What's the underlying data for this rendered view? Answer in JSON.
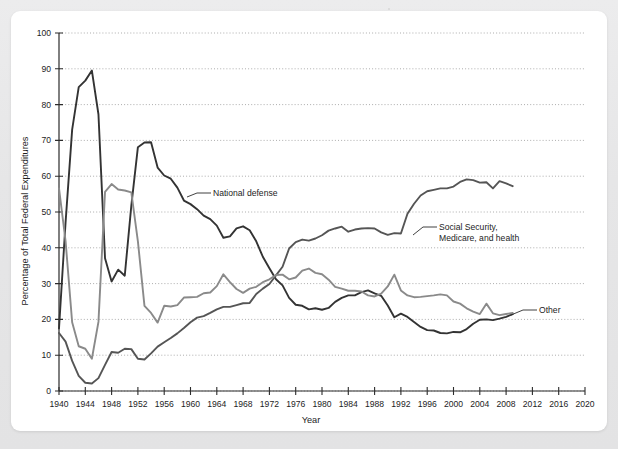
{
  "figure": {
    "panel_background": "#ffffff",
    "page_background": "#e8e8e8"
  },
  "chart_data": {
    "type": "line",
    "title": "",
    "xlabel": "Year",
    "ylabel": "Percentage of Total Federal Expenditures",
    "xlim": [
      1940,
      2020
    ],
    "ylim": [
      0,
      100
    ],
    "xticks": [
      1940,
      1944,
      1948,
      1952,
      1956,
      1960,
      1964,
      1968,
      1972,
      1976,
      1980,
      1984,
      1988,
      1992,
      1996,
      2000,
      2004,
      2008,
      2012,
      2016,
      2020
    ],
    "yticks": [
      0,
      10,
      20,
      30,
      40,
      50,
      60,
      70,
      80,
      90,
      100
    ],
    "xtick_labels": [
      "1940",
      "1944",
      "1948",
      "1952",
      "1956",
      "1960",
      "1964",
      "1968",
      "1972",
      "1976",
      "1980",
      "1984",
      "1988",
      "1992",
      "1996",
      "2000",
      "2004",
      "2008",
      "2012",
      "2016",
      "2020"
    ],
    "ytick_labels": [
      "0",
      "10",
      "20",
      "30",
      "40",
      "50",
      "60",
      "70",
      "80",
      "90",
      "100"
    ],
    "grid": true,
    "grid_axis": "y",
    "legend": "inline-annotations",
    "x": [
      1940,
      1941,
      1942,
      1943,
      1944,
      1945,
      1946,
      1947,
      1948,
      1949,
      1950,
      1951,
      1952,
      1953,
      1954,
      1955,
      1956,
      1957,
      1958,
      1959,
      1960,
      1961,
      1962,
      1963,
      1964,
      1965,
      1966,
      1967,
      1968,
      1969,
      1970,
      1971,
      1972,
      1973,
      1974,
      1975,
      1976,
      1977,
      1978,
      1979,
      1980,
      1981,
      1982,
      1983,
      1984,
      1985,
      1986,
      1987,
      1988,
      1989,
      1990,
      1991,
      1992,
      1993,
      1994,
      1995,
      1996,
      1997,
      1998,
      1999,
      2000,
      2001,
      2002,
      2003,
      2004,
      2005,
      2006,
      2007,
      2008,
      2009
    ],
    "series": [
      {
        "name": "National defense",
        "color": "#333333",
        "label_anchor_year": 1962,
        "values": [
          17.5,
          47.1,
          73.0,
          84.9,
          86.7,
          89.5,
          77.3,
          37.1,
          30.6,
          33.9,
          32.2,
          51.8,
          68.1,
          69.4,
          69.5,
          62.4,
          60.2,
          59.3,
          56.8,
          53.2,
          52.2,
          50.8,
          49.0,
          48.0,
          46.2,
          42.8,
          43.2,
          45.4,
          46.0,
          44.9,
          41.8,
          37.5,
          34.3,
          31.2,
          29.5,
          26.0,
          24.1,
          23.8,
          22.8,
          23.1,
          22.7,
          23.2,
          24.9,
          26.0,
          26.7,
          26.7,
          27.6,
          28.1,
          27.3,
          26.6,
          23.9,
          20.6,
          21.6,
          20.7,
          19.3,
          17.9,
          17.0,
          16.9,
          16.2,
          16.1,
          16.5,
          16.4,
          17.3,
          18.8,
          19.9,
          20.0,
          19.8,
          20.2,
          20.7,
          21.5
        ]
      },
      {
        "name": "Social Security, Medicare, and health",
        "color": "#555555",
        "label_anchor_year": 1990,
        "values": [
          16.2,
          13.8,
          8.4,
          4.2,
          2.3,
          2.1,
          3.6,
          7.3,
          10.9,
          10.7,
          11.8,
          11.7,
          9.0,
          8.8,
          10.5,
          12.4,
          13.6,
          14.8,
          16.1,
          17.6,
          19.2,
          20.5,
          20.9,
          21.8,
          22.8,
          23.5,
          23.5,
          24.0,
          24.5,
          24.6,
          27.1,
          28.6,
          29.9,
          32.3,
          34.7,
          39.8,
          41.6,
          42.3,
          42.0,
          42.6,
          43.5,
          44.8,
          45.4,
          45.9,
          44.5,
          45.1,
          45.4,
          45.5,
          45.4,
          44.3,
          43.6,
          44.1,
          44.0,
          49.5,
          52.3,
          54.6,
          55.8,
          56.2,
          56.6,
          56.6,
          57.1,
          58.4,
          59.1,
          58.9,
          58.2,
          58.3,
          56.6,
          58.6,
          58.0,
          57.2
        ]
      },
      {
        "name": "Other",
        "color": "#8a8a8a",
        "label_anchor_year": 2007,
        "values": [
          56.6,
          41.9,
          19.2,
          12.5,
          11.8,
          9.0,
          19.3,
          55.6,
          57.8,
          56.3,
          56.0,
          55.5,
          41.8,
          23.8,
          21.8,
          19.1,
          23.8,
          23.6,
          24.0,
          26.1,
          26.2,
          26.3,
          27.3,
          27.5,
          29.3,
          32.6,
          30.4,
          28.5,
          27.4,
          28.6,
          29.1,
          30.4,
          31.2,
          32.4,
          32.5,
          31.2,
          31.7,
          33.6,
          34.2,
          33.0,
          32.6,
          31.1,
          29.1,
          28.6,
          28.0,
          28.0,
          27.8,
          26.7,
          26.4,
          27.2,
          29.2,
          32.5,
          28.1,
          26.7,
          26.2,
          26.3,
          26.5,
          26.7,
          27.0,
          26.7,
          25.0,
          24.4,
          23.1,
          22.2,
          21.5,
          24.4,
          21.7,
          21.2,
          21.5,
          21.8
        ]
      }
    ],
    "annotations": [
      {
        "id": "national-defense",
        "lines": [
          "National defense"
        ],
        "text": "National defense"
      },
      {
        "id": "social-security",
        "lines": [
          "Social Security,",
          "Medicare, and health"
        ],
        "text": "Social Security, Medicare, and health"
      },
      {
        "id": "other",
        "lines": [
          "Other"
        ],
        "text": "Other"
      }
    ]
  },
  "axes": {
    "y_title": "Percentage of Total Federal Expenditures",
    "x_title": "Year"
  }
}
